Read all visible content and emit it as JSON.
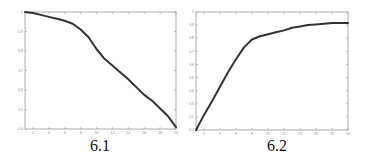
{
  "chart_data": [
    {
      "type": "line",
      "title": "",
      "caption": "6.1",
      "xlabel": "",
      "ylabel": "",
      "xlim": [
        1,
        20
      ],
      "ylim": [
        0.4,
        1.0
      ],
      "xticks": [
        2,
        4,
        6,
        8,
        10,
        12,
        14,
        16,
        18,
        20
      ],
      "yticks": [
        0.4,
        0.5,
        0.6,
        0.7,
        0.8,
        0.9,
        1
      ],
      "grid": false,
      "legend": null,
      "series": [
        {
          "name": "curve",
          "x": [
            1,
            2,
            3,
            4,
            5,
            6,
            7,
            8,
            9,
            10,
            11,
            12,
            13,
            14,
            15,
            16,
            17,
            18,
            19,
            20
          ],
          "values": [
            1.0,
            0.995,
            0.985,
            0.975,
            0.965,
            0.955,
            0.94,
            0.91,
            0.87,
            0.81,
            0.76,
            0.725,
            0.69,
            0.655,
            0.615,
            0.575,
            0.545,
            0.505,
            0.465,
            0.41
          ]
        }
      ]
    },
    {
      "type": "line",
      "title": "",
      "caption": "6.2",
      "xlabel": "",
      "ylabel": "",
      "xlim": [
        1,
        20
      ],
      "ylim": [
        0.1,
        1.0
      ],
      "xticks": [
        2,
        4,
        6,
        8,
        10,
        12,
        14,
        16,
        18,
        20
      ],
      "yticks": [
        0.1,
        0.2,
        0.3,
        0.4,
        0.5,
        0.6,
        0.7,
        0.8,
        0.9,
        1
      ],
      "grid": false,
      "legend": null,
      "series": [
        {
          "name": "curve",
          "x": [
            1,
            2,
            3,
            4,
            5,
            6,
            7,
            8,
            9,
            10,
            11,
            12,
            13,
            14,
            15,
            16,
            17,
            18,
            19,
            20
          ],
          "values": [
            0.1,
            0.215,
            0.32,
            0.43,
            0.54,
            0.64,
            0.73,
            0.79,
            0.815,
            0.83,
            0.845,
            0.86,
            0.88,
            0.89,
            0.9,
            0.905,
            0.91,
            0.915,
            0.915,
            0.915
          ]
        }
      ]
    }
  ],
  "captions": [
    "6.1",
    "6.2"
  ],
  "style": {
    "line_color": "#333333",
    "axis_color": "#999999",
    "tick_label_color": "#888888"
  }
}
